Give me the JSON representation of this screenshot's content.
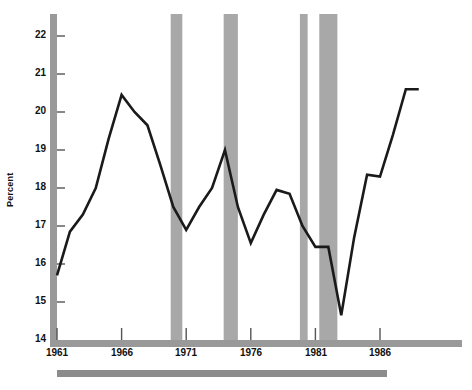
{
  "chart_data": {
    "type": "line",
    "title": "",
    "subtitle": "",
    "xlabel": "",
    "ylabel": "Percent",
    "xlim": [
      1961,
      1991
    ],
    "ylim": [
      14,
      22.5
    ],
    "grid": false,
    "legend": null,
    "x_ticks": [
      "1961",
      "1966",
      "1971",
      "1976",
      "1981",
      "1986"
    ],
    "x_tick_values": [
      1961,
      1966,
      1971,
      1976,
      1981,
      1986
    ],
    "y_ticks": [
      "14",
      "15",
      "16",
      "17",
      "18",
      "19",
      "20",
      "21",
      "22"
    ],
    "y_tick_values": [
      14,
      15,
      16,
      17,
      18,
      19,
      20,
      21,
      22
    ],
    "series": [
      {
        "name": "Percent",
        "color": "#1a1a1a",
        "x": [
          1961,
          1962,
          1963,
          1964,
          1965,
          1966,
          1967,
          1968,
          1969,
          1970,
          1971,
          1972,
          1973,
          1974,
          1975,
          1976,
          1977,
          1978,
          1979,
          1980,
          1981,
          1982,
          1983,
          1984,
          1985,
          1986,
          1987,
          1988,
          1989
        ],
        "values": [
          15.7,
          16.85,
          17.3,
          18.0,
          19.3,
          20.45,
          20.0,
          19.65,
          18.6,
          17.5,
          16.9,
          17.5,
          18.0,
          19.0,
          17.5,
          16.55,
          17.3,
          17.95,
          17.85,
          17.0,
          16.45,
          16.45,
          14.65,
          16.7,
          18.35,
          18.3,
          19.4,
          20.6,
          20.6
        ]
      }
    ],
    "recession_bands": [
      {
        "start": 1969.8,
        "end": 1970.7
      },
      {
        "start": 1973.9,
        "end": 1975.0
      },
      {
        "start": 1979.8,
        "end": 1980.4
      },
      {
        "start": 1981.3,
        "end": 1982.7
      }
    ],
    "recession_band_color": "#a8a8a8",
    "axis_color": "#999999",
    "footer_bar_color": "#8c8c8c"
  }
}
